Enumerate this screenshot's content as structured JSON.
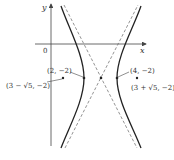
{
  "figure": {
    "type": "hyperbola",
    "equation_form": "(x-3)^2 - (y+2)^2/4 = 1",
    "axes": {
      "x_label": "x",
      "y_label": "y",
      "origin_label": "0"
    },
    "center": {
      "x": 3,
      "y": -2
    },
    "vertices": [
      {
        "label": "(2, −2)",
        "x": 2,
        "y": -2
      },
      {
        "label": "(4, −2)",
        "x": 4,
        "y": -2
      }
    ],
    "foci": [
      {
        "label": "(3 − √5, −2)",
        "x": 0.764,
        "y": -2
      },
      {
        "label": "(3 + √5, −2)",
        "x": 5.236,
        "y": -2
      }
    ],
    "asymptotes": [
      {
        "slope": 2,
        "style": "dashed"
      },
      {
        "slope": -2,
        "style": "dashed"
      }
    ],
    "colors": {
      "curve": "#222222",
      "axis": "#444444",
      "asymptote": "#666666",
      "text": "#333333"
    }
  }
}
